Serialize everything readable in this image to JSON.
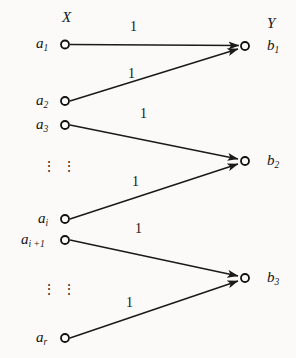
{
  "figure": {
    "type": "bipartite-graph-diagram",
    "set_left_label": "X",
    "set_right_label": "Y",
    "dots_glyph": "⋮",
    "left_nodes": [
      {
        "label": "a",
        "sub": "1"
      },
      {
        "label": "a",
        "sub": "2"
      },
      {
        "label": "a",
        "sub": "3"
      },
      {
        "label": "a",
        "sub": "i"
      },
      {
        "label": "a",
        "sub": "i +1"
      },
      {
        "label": "a",
        "sub": "r"
      }
    ],
    "right_nodes": [
      {
        "label": "b",
        "sub": "1"
      },
      {
        "label": "b",
        "sub": "2"
      },
      {
        "label": "b",
        "sub": "3"
      }
    ],
    "edges": [
      {
        "from": "a1",
        "to": "b1",
        "weight": "1"
      },
      {
        "from": "a2",
        "to": "b1",
        "weight": "1"
      },
      {
        "from": "a3",
        "to": "b2",
        "weight": "1"
      },
      {
        "from": "ai",
        "to": "b2",
        "weight": "1"
      },
      {
        "from": "ai+1",
        "to": "b3",
        "weight": "1"
      },
      {
        "from": "ar",
        "to": "b3",
        "weight": "1"
      }
    ],
    "colors": {
      "ink": "#141414",
      "paper": "#fbfaf8",
      "line": "#1a1a1a"
    }
  }
}
